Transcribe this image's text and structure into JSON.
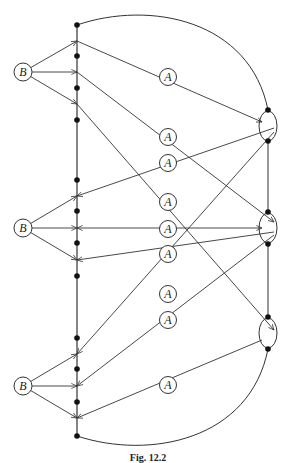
{
  "figure": {
    "caption": "Fig. 12.2",
    "colors": {
      "stroke": "#333333",
      "dot": "#111111",
      "background": "#ffffff"
    }
  },
  "bar": {
    "x": 77,
    "y_top": 25,
    "y_bottom": 436,
    "dots": [
      25,
      56,
      88,
      120,
      180,
      211,
      243,
      276,
      338,
      369,
      402,
      436
    ],
    "junctions": [
      41,
      72,
      104,
      196,
      228,
      260,
      354,
      386,
      418
    ]
  },
  "b_nodes": [
    {
      "label": "B",
      "x": 23,
      "y": 72
    },
    {
      "label": "B",
      "x": 23,
      "y": 228
    },
    {
      "label": "B",
      "x": 23,
      "y": 386
    }
  ],
  "a_nodes": [
    {
      "label": "A",
      "x": 168,
      "y": 77
    },
    {
      "label": "A",
      "x": 168,
      "y": 137
    },
    {
      "label": "A",
      "x": 168,
      "y": 163
    },
    {
      "label": "A",
      "x": 168,
      "y": 202
    },
    {
      "label": "A",
      "x": 168,
      "y": 229
    },
    {
      "label": "A",
      "x": 168,
      "y": 254
    },
    {
      "label": "A",
      "x": 168,
      "y": 294
    },
    {
      "label": "A",
      "x": 168,
      "y": 320
    },
    {
      "label": "A",
      "x": 168,
      "y": 385
    }
  ],
  "right_nodes": [
    {
      "cx": 268,
      "cy": 126,
      "rx": 9,
      "ry": 15,
      "top_dot": 110,
      "bottom_dot": 141
    },
    {
      "cx": 268,
      "cy": 228,
      "rx": 9,
      "ry": 15,
      "top_dot": 212,
      "bottom_dot": 244
    },
    {
      "cx": 268,
      "cy": 333,
      "rx": 9,
      "ry": 15,
      "top_dot": 317,
      "bottom_dot": 349
    }
  ],
  "edges": [
    {
      "from": [
        77,
        41
      ],
      "to": [
        262,
        122
      ],
      "via_a": 0,
      "arrow_end": "right"
    },
    {
      "from": [
        77,
        72
      ],
      "to": [
        274,
        222
      ],
      "via_a": 1,
      "arrow_end": "right"
    },
    {
      "from": [
        77,
        104
      ],
      "to": [
        274,
        330
      ],
      "via_a": 3,
      "arrow_end": "right"
    },
    {
      "from": [
        274,
        128
      ],
      "to": [
        77,
        196
      ],
      "via_a": 2,
      "arrow_end": "left"
    },
    {
      "from": [
        262,
        228
      ],
      "to": [
        77,
        228
      ],
      "via_a": 4,
      "arrow_end": "both"
    },
    {
      "from": [
        274,
        232
      ],
      "to": [
        77,
        260
      ],
      "via_a": 5,
      "arrow_end": "left"
    },
    {
      "from": [
        274,
        132
      ],
      "to": [
        77,
        354
      ],
      "via_a": 6,
      "arrow_end": "left"
    },
    {
      "from": [
        274,
        235
      ],
      "to": [
        77,
        386
      ],
      "via_a": 7,
      "arrow_end": "left"
    },
    {
      "from": [
        262,
        340
      ],
      "to": [
        77,
        418
      ],
      "via_a": 8,
      "arrow_end": "left"
    }
  ],
  "b_edges": [
    {
      "from": 0,
      "to_y": [
        41,
        72,
        104
      ]
    },
    {
      "from": 1,
      "to_y": [
        196,
        228,
        260
      ]
    },
    {
      "from": 2,
      "to_y": [
        354,
        386,
        418
      ]
    }
  ],
  "arcs": [
    {
      "name": "top-arc",
      "d": "M77,25 C150,0 250,20 268,110"
    },
    {
      "name": "bottom-arc",
      "d": "M77,436 C150,460 250,440 268,349"
    }
  ]
}
